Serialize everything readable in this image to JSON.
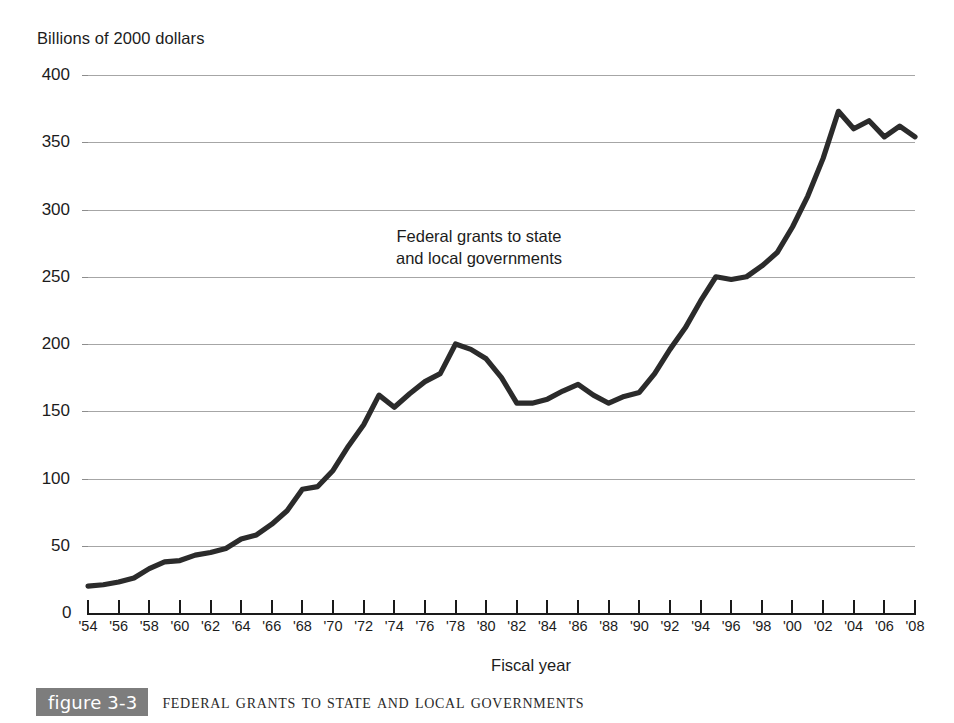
{
  "figure": {
    "tag_label": "figure 3-3",
    "caption": "Federal Grants to State and Local Governments",
    "tag_bg_color": "#7d7d7d"
  },
  "chart_data": {
    "type": "line",
    "title": "Federal Grants to State and Local Governments",
    "subtitle": "",
    "unit_label": "Billions of 2000 dollars",
    "ylabel": "Billions of 2000 dollars",
    "xlabel": "Fiscal year",
    "ylim": [
      0,
      400
    ],
    "ytick_labels": [
      "400",
      "350",
      "300",
      "250",
      "200",
      "150",
      "100",
      "50"
    ],
    "ytick_values": [
      400,
      350,
      300,
      250,
      200,
      150,
      100,
      50
    ],
    "y_origin_label": "0",
    "grid": true,
    "grid_axis": "y",
    "legend_position": "none",
    "annotations": [
      {
        "text_line1": "Federal grants to state",
        "text_line2": "and local governments"
      }
    ],
    "xlim": [
      1954,
      2008
    ],
    "xtick_labels": [
      "'54",
      "'56",
      "'58",
      "'60",
      "'62",
      "'64",
      "'66",
      "'68",
      "'70",
      "'72",
      "'74",
      "'76",
      "'78",
      "'80",
      "'82",
      "'84",
      "'86",
      "'88",
      "'90",
      "'92",
      "'94",
      "'96",
      "'98",
      "'00",
      "'02",
      "'04",
      "'06",
      "'08"
    ],
    "xtick_values": [
      1954,
      1956,
      1958,
      1960,
      1962,
      1964,
      1966,
      1968,
      1970,
      1972,
      1974,
      1976,
      1978,
      1980,
      1982,
      1984,
      1986,
      1988,
      1990,
      1992,
      1994,
      1996,
      1998,
      2000,
      2002,
      2004,
      2006,
      2008
    ],
    "series": [
      {
        "name": "Federal grants to state and local governments",
        "color": "#2b2b2b",
        "x": [
          1954,
          1955,
          1956,
          1957,
          1958,
          1959,
          1960,
          1961,
          1962,
          1963,
          1964,
          1965,
          1966,
          1967,
          1968,
          1969,
          1970,
          1971,
          1972,
          1973,
          1974,
          1975,
          1976,
          1977,
          1978,
          1979,
          1980,
          1981,
          1982,
          1983,
          1984,
          1985,
          1986,
          1987,
          1988,
          1989,
          1990,
          1991,
          1992,
          1993,
          1994,
          1995,
          1996,
          1997,
          1998,
          1999,
          2000,
          2001,
          2002,
          2003,
          2004,
          2005,
          2006,
          2007,
          2008
        ],
        "y": [
          20,
          21,
          23,
          26,
          33,
          38,
          39,
          43,
          45,
          48,
          55,
          58,
          66,
          76,
          92,
          94,
          106,
          124,
          140,
          162,
          153,
          163,
          172,
          178,
          200,
          196,
          189,
          175,
          156,
          156,
          159,
          165,
          170,
          162,
          156,
          161,
          164,
          178,
          196,
          212,
          232,
          250,
          248,
          250,
          258,
          268,
          287,
          310,
          338,
          373,
          360,
          366,
          354,
          362,
          354
        ]
      }
    ]
  }
}
